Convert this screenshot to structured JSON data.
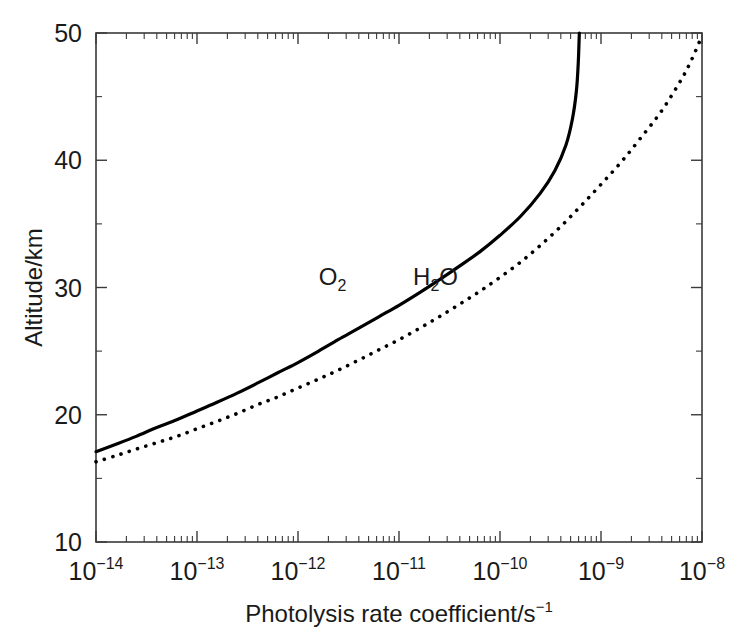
{
  "figure": {
    "background_color": "#ffffff",
    "axis_color": "#3a3a3a",
    "curve_color": "#000000"
  },
  "chart_data": {
    "type": "line",
    "title": "",
    "xlabel": "Photolysis rate coefficient/s",
    "xlabel_exponent": "−1",
    "ylabel": "Altitude/km",
    "xscale": "log",
    "yscale": "linear",
    "xlim": [
      1e-14,
      1e-08
    ],
    "ylim": [
      10,
      50
    ],
    "grid": false,
    "legend_position": "inline-annotation",
    "x_tick_labels": [
      {
        "base": "10",
        "exponent": "−14",
        "value": 1e-14
      },
      {
        "base": "10",
        "exponent": "−13",
        "value": 1e-13
      },
      {
        "base": "10",
        "exponent": "−12",
        "value": 1e-12
      },
      {
        "base": "10",
        "exponent": "−11",
        "value": 1e-11
      },
      {
        "base": "10",
        "exponent": "−10",
        "value": 1e-10
      },
      {
        "base": "10",
        "exponent": "−9",
        "value": 1e-09
      },
      {
        "base": "10",
        "exponent": "−8",
        "value": 1e-08
      }
    ],
    "y_tick_labels": [
      "10",
      "20",
      "30",
      "40",
      "50"
    ],
    "y_ticks_major": [
      10,
      20,
      30,
      40,
      50
    ],
    "y_ticks_minor": [
      15,
      25,
      35,
      45
    ],
    "annotations": [
      {
        "text": "O",
        "subscript": "2",
        "x_value": 2.2e-12,
        "y_value": 30.2
      },
      {
        "text": "H",
        "subscript": "2",
        "text_after": "O",
        "x_value": 2.3e-11,
        "y_value": 30.2
      }
    ],
    "series": [
      {
        "name": "O2",
        "label": "O₂",
        "style": "solid",
        "points": [
          {
            "x": 1e-14,
            "y": 17.1
          },
          {
            "x": 1.6e-14,
            "y": 17.7
          },
          {
            "x": 2.5e-14,
            "y": 18.3
          },
          {
            "x": 4e-14,
            "y": 19.0
          },
          {
            "x": 6.3e-14,
            "y": 19.6
          },
          {
            "x": 1e-13,
            "y": 20.3
          },
          {
            "x": 1.6e-13,
            "y": 21.0
          },
          {
            "x": 2.5e-13,
            "y": 21.7
          },
          {
            "x": 4e-13,
            "y": 22.5
          },
          {
            "x": 6.3e-13,
            "y": 23.3
          },
          {
            "x": 1e-12,
            "y": 24.1
          },
          {
            "x": 1.6e-12,
            "y": 25.0
          },
          {
            "x": 2.5e-12,
            "y": 25.9
          },
          {
            "x": 4e-12,
            "y": 26.8
          },
          {
            "x": 6.3e-12,
            "y": 27.7
          },
          {
            "x": 1e-11,
            "y": 28.6
          },
          {
            "x": 1.6e-11,
            "y": 29.6
          },
          {
            "x": 2.5e-11,
            "y": 30.6
          },
          {
            "x": 4e-11,
            "y": 31.7
          },
          {
            "x": 6.3e-11,
            "y": 32.8
          },
          {
            "x": 1e-10,
            "y": 34.1
          },
          {
            "x": 1.6e-10,
            "y": 35.6
          },
          {
            "x": 2.5e-10,
            "y": 37.4
          },
          {
            "x": 3.5e-10,
            "y": 39.2
          },
          {
            "x": 4.5e-10,
            "y": 41.2
          },
          {
            "x": 5.2e-10,
            "y": 43.2
          },
          {
            "x": 5.7e-10,
            "y": 45.4
          },
          {
            "x": 5.95e-10,
            "y": 47.6
          },
          {
            "x": 6.1e-10,
            "y": 50.0
          }
        ]
      },
      {
        "name": "H2O",
        "label": "H₂O",
        "style": "dotted",
        "points": [
          {
            "x": 1e-14,
            "y": 16.3
          },
          {
            "x": 1.6e-14,
            "y": 16.8
          },
          {
            "x": 2.5e-14,
            "y": 17.3
          },
          {
            "x": 4e-14,
            "y": 17.8
          },
          {
            "x": 6.3e-14,
            "y": 18.3
          },
          {
            "x": 1e-13,
            "y": 18.9
          },
          {
            "x": 1.6e-13,
            "y": 19.5
          },
          {
            "x": 2.5e-13,
            "y": 20.1
          },
          {
            "x": 4e-13,
            "y": 20.8
          },
          {
            "x": 6.3e-13,
            "y": 21.4
          },
          {
            "x": 1e-12,
            "y": 22.1
          },
          {
            "x": 1.6e-12,
            "y": 22.8
          },
          {
            "x": 2.5e-12,
            "y": 23.5
          },
          {
            "x": 4e-12,
            "y": 24.3
          },
          {
            "x": 6.3e-12,
            "y": 25.1
          },
          {
            "x": 1e-11,
            "y": 25.9
          },
          {
            "x": 1.6e-11,
            "y": 26.8
          },
          {
            "x": 2.5e-11,
            "y": 27.7
          },
          {
            "x": 4e-11,
            "y": 28.7
          },
          {
            "x": 6.3e-11,
            "y": 29.7
          },
          {
            "x": 1e-10,
            "y": 30.8
          },
          {
            "x": 1.6e-10,
            "y": 32.0
          },
          {
            "x": 2.5e-10,
            "y": 33.3
          },
          {
            "x": 4e-10,
            "y": 34.8
          },
          {
            "x": 6.3e-10,
            "y": 36.4
          },
          {
            "x": 1e-09,
            "y": 38.1
          },
          {
            "x": 1.6e-09,
            "y": 39.9
          },
          {
            "x": 2.5e-09,
            "y": 41.8
          },
          {
            "x": 4e-09,
            "y": 43.9
          },
          {
            "x": 6.3e-09,
            "y": 46.4
          },
          {
            "x": 8e-09,
            "y": 48.0
          },
          {
            "x": 1e-08,
            "y": 49.8
          }
        ]
      }
    ]
  }
}
